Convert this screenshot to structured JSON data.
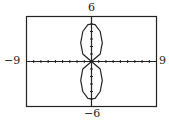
{
  "chart_data": {
    "type": "line",
    "title": "",
    "xlabel": "",
    "ylabel": "",
    "xlim": [
      -9,
      9
    ],
    "ylim": [
      -6,
      6
    ],
    "tick_labels": {
      "top": "6",
      "bottom": "−6",
      "left": "−9",
      "right": "9"
    },
    "axis_tick_spacing": 1,
    "grid": false,
    "series": [
      {
        "name": "curve",
        "points_upper_lobe": [
          [
            0,
            0
          ],
          [
            1.2,
            1
          ],
          [
            1.5,
            2.5
          ],
          [
            1.2,
            4
          ],
          [
            0.5,
            4.9
          ],
          [
            0,
            5
          ],
          [
            -0.5,
            4.9
          ],
          [
            -1.2,
            4
          ],
          [
            -1.5,
            2.5
          ],
          [
            -1.2,
            1
          ],
          [
            0,
            0
          ]
        ],
        "points_lower_lobe": [
          [
            0,
            0
          ],
          [
            1.2,
            -1
          ],
          [
            1.5,
            -2.5
          ],
          [
            1.2,
            -4
          ],
          [
            0.5,
            -4.9
          ],
          [
            0,
            -5
          ],
          [
            -0.5,
            -4.9
          ],
          [
            -1.2,
            -4
          ],
          [
            -1.5,
            -2.5
          ],
          [
            -1.2,
            -1
          ],
          [
            0,
            0
          ]
        ]
      }
    ]
  },
  "colors": {
    "frame": "#222222",
    "curve": "#222222",
    "background": "#ffffff"
  }
}
